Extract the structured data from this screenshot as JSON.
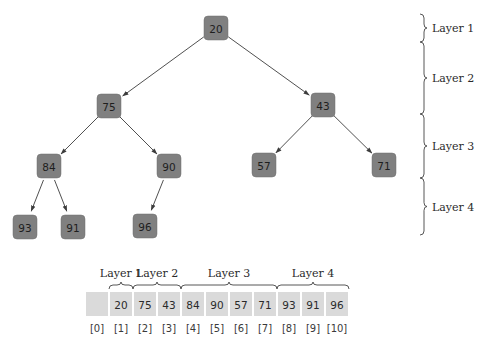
{
  "tree": {
    "nodes": [
      {
        "id": "n1",
        "value": "20",
        "layer": 1,
        "cx": 216,
        "cy": 28
      },
      {
        "id": "n2",
        "value": "75",
        "layer": 2,
        "cx": 109,
        "cy": 106
      },
      {
        "id": "n3",
        "value": "43",
        "layer": 2,
        "cx": 323,
        "cy": 105
      },
      {
        "id": "n4",
        "value": "84",
        "layer": 3,
        "cx": 49,
        "cy": 166
      },
      {
        "id": "n5",
        "value": "90",
        "layer": 3,
        "cx": 169,
        "cy": 166
      },
      {
        "id": "n6",
        "value": "57",
        "layer": 3,
        "cx": 264,
        "cy": 165
      },
      {
        "id": "n7",
        "value": "71",
        "layer": 3,
        "cx": 384,
        "cy": 165
      },
      {
        "id": "n8",
        "value": "93",
        "layer": 4,
        "cx": 25,
        "cy": 227
      },
      {
        "id": "n9",
        "value": "91",
        "layer": 4,
        "cx": 73,
        "cy": 227
      },
      {
        "id": "n10",
        "value": "96",
        "layer": 4,
        "cx": 145,
        "cy": 226
      }
    ],
    "edges": [
      {
        "from": "20",
        "to": "75"
      },
      {
        "from": "20",
        "to": "43"
      },
      {
        "from": "75",
        "to": "84"
      },
      {
        "from": "75",
        "to": "90"
      },
      {
        "from": "43",
        "to": "57"
      },
      {
        "from": "43",
        "to": "71"
      },
      {
        "from": "84",
        "to": "93"
      },
      {
        "from": "84",
        "to": "91"
      },
      {
        "from": "90",
        "to": "96"
      }
    ]
  },
  "layer_braces": [
    {
      "label": "Layer 1",
      "y_top": 14,
      "y_bottom": 42
    },
    {
      "label": "Layer 2",
      "y_top": 42,
      "y_bottom": 114
    },
    {
      "label": "Layer 3",
      "y_top": 114,
      "y_bottom": 178
    },
    {
      "label": "Layer 4",
      "y_top": 178,
      "y_bottom": 235
    }
  ],
  "array": {
    "cells": [
      "",
      "20",
      "75",
      "43",
      "84",
      "90",
      "57",
      "71",
      "93",
      "91",
      "96"
    ],
    "indices": [
      "[0]",
      "[1]",
      "[2]",
      "[3]",
      "[4]",
      "[5]",
      "[6]",
      "[7]",
      "[8]",
      "[9]",
      "[10]"
    ],
    "layer_groups": [
      {
        "label": "Layer 1",
        "from_index": 1,
        "to_index": 1
      },
      {
        "label": "Layer 2",
        "from_index": 2,
        "to_index": 3
      },
      {
        "label": "Layer 3",
        "from_index": 4,
        "to_index": 7
      },
      {
        "label": "Layer 4",
        "from_index": 8,
        "to_index": 10
      }
    ]
  },
  "colors": {
    "node_fill": "#808080",
    "cell_fill": "#dadada",
    "edge": "#3c3c3c"
  }
}
